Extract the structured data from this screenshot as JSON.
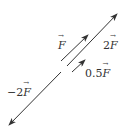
{
  "diagram": {
    "title": "",
    "stroke_color": "#333333",
    "vectors": [
      {
        "id": "F",
        "coef": "",
        "symbol": "F",
        "x1": 61,
        "y1": 61,
        "x2": 88,
        "y2": 35
      },
      {
        "id": "2F",
        "coef": "2",
        "symbol": "F",
        "x1": 67,
        "y1": 66,
        "x2": 117,
        "y2": 14
      },
      {
        "id": "0.5F",
        "coef": "0.5",
        "symbol": "F",
        "x1": 72,
        "y1": 72,
        "x2": 85,
        "y2": 60
      },
      {
        "id": "-2F",
        "coef": "−2",
        "symbol": "F",
        "x1": 61,
        "y1": 72,
        "x2": 9,
        "y2": 125
      }
    ],
    "labels": {
      "F": {
        "coef": "",
        "symbol": "F"
      },
      "twoF": {
        "coef": "2",
        "symbol": "F"
      },
      "halfF": {
        "coef": "0.5",
        "symbol": "F"
      },
      "negTwoF": {
        "coef": "−2",
        "symbol": "F"
      }
    }
  }
}
